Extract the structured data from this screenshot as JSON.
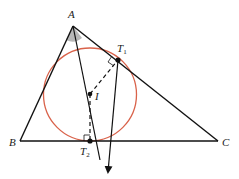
{
  "diagram": {
    "type": "geometry",
    "points": {
      "A": {
        "label": "A",
        "x": 73,
        "y": 26
      },
      "B": {
        "label": "B",
        "x": 20,
        "y": 141
      },
      "C": {
        "label": "C",
        "x": 218,
        "y": 141
      },
      "I": {
        "label": "I",
        "x": 90,
        "y": 94
      },
      "T1": {
        "label": "T",
        "sub": "1",
        "x": 118,
        "y": 60
      },
      "T2": {
        "label": "T",
        "sub": "2",
        "x": 90,
        "y": 141
      }
    },
    "incircle": {
      "cx": 90,
      "cy": 94.5,
      "r": 46.5,
      "color": "#d9624a"
    },
    "colors": {
      "line": "#111111",
      "circle": "#d9624a",
      "angle_fill": "#b8b8b8"
    }
  }
}
